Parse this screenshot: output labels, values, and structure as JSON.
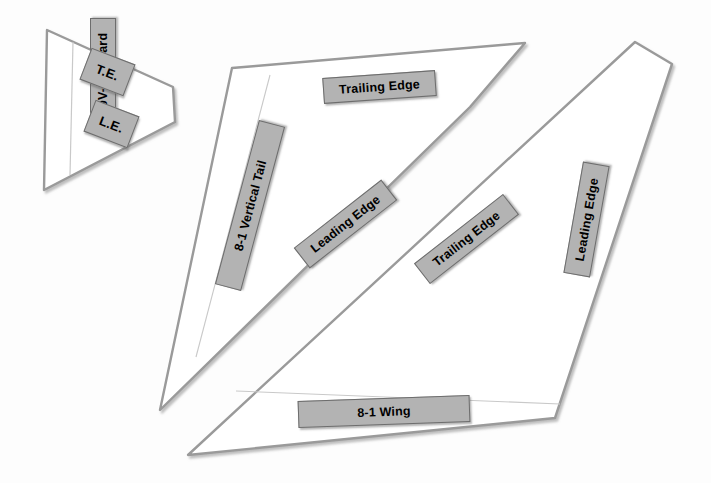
{
  "diagram": {
    "background_color": "#fdfdfd",
    "outline_color": "#9a9a9a",
    "label_fill": "#b3b3b3",
    "label_border": "#6d6d6d",
    "label_text_color": "#000000"
  },
  "parts": [
    {
      "id": "canard",
      "name_label": "9V-2 Canard",
      "edges": [
        {
          "code": "T.E.",
          "meaning": "Trailing Edge"
        },
        {
          "code": "L.E.",
          "meaning": "Leading Edge"
        }
      ]
    },
    {
      "id": "vertical-tail",
      "name_label": "8-1 Vertical Tail",
      "edges": [
        {
          "code": "Trailing Edge"
        },
        {
          "code": "Leading Edge"
        }
      ]
    },
    {
      "id": "wing",
      "name_label": "8-1 Wing",
      "edges": [
        {
          "code": "Trailing Edge"
        },
        {
          "code": "Leading Edge"
        }
      ]
    }
  ],
  "labels": {
    "canard_name": "9V-2 Canard",
    "canard_te": "T.E.",
    "canard_le": "L.E.",
    "tail_name": "8-1 Vertical Tail",
    "tail_trailing_edge": "Trailing Edge",
    "tail_leading_edge": "Leading Edge",
    "wing_trailing_edge": "Trailing Edge",
    "wing_leading_edge": "Leading Edge",
    "wing_name": "8-1 Wing"
  }
}
